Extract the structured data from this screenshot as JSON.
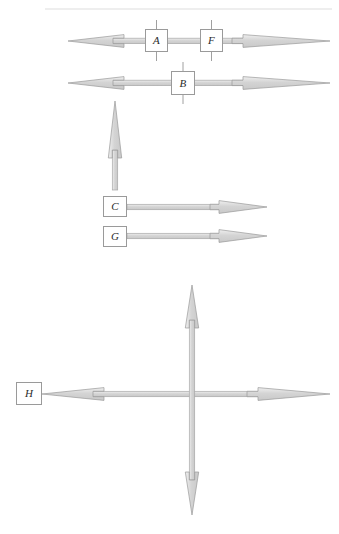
{
  "figure": {
    "background_color": "#ffffff",
    "width": 339,
    "height": 534,
    "top_rule": {
      "name": "header-rule",
      "color": "#e8e8e8",
      "x1": 45,
      "x2": 332,
      "y": 9
    },
    "palette": {
      "arrow_fill": "#d6d6d6",
      "arrow_fill_light": "#e4e4e4",
      "arrow_stroke": "#9a9a9a",
      "shaft_fill": "#dcdcdc",
      "shaft_stroke": "#a6a6a6",
      "box_stroke": "#9a9a9a",
      "box_fill": "#ffffff",
      "tick_color": "#a0a0a0",
      "text_color": "#2b2b2b"
    },
    "nodes": [
      {
        "id": "A",
        "label": "A",
        "x": 145,
        "y": 29,
        "size": "sz-a",
        "ticks": "vertical"
      },
      {
        "id": "F",
        "label": "F",
        "x": 200,
        "y": 29,
        "size": "sz-a",
        "ticks": "vertical"
      },
      {
        "id": "B",
        "label": "B",
        "x": 171,
        "y": 71,
        "size": "sz-b",
        "ticks": "vertical"
      },
      {
        "id": "C",
        "label": "C",
        "x": 103,
        "y": 196,
        "size": "sz-c",
        "ticks": "none"
      },
      {
        "id": "G",
        "label": "G",
        "x": 103,
        "y": 226,
        "size": "sz-c",
        "ticks": "none"
      },
      {
        "id": "H",
        "label": "H",
        "x": 16,
        "y": 382,
        "size": "sz-h",
        "ticks": "none"
      }
    ],
    "arrows": [
      {
        "name": "arrow-row-a-f",
        "orientation": "horizontal",
        "heads": "both",
        "y": 41,
        "x_start": 68,
        "x_end": 330,
        "description": "Double-headed horizontal arrow passing through boxes A and F"
      },
      {
        "name": "arrow-row-b",
        "orientation": "horizontal",
        "heads": "both",
        "y": 83,
        "x_start": 68,
        "x_end": 330,
        "description": "Double-headed horizontal arrow passing through box B"
      },
      {
        "name": "arrow-vertical-up",
        "orientation": "vertical",
        "heads": "up",
        "x": 115,
        "y_start": 190,
        "y_end": 101,
        "description": "Upward single-headed arrow rising from above box C"
      },
      {
        "name": "arrow-row-c",
        "orientation": "horizontal",
        "heads": "right",
        "y": 207,
        "x_start": 127,
        "x_end": 267,
        "description": "Rightward arrow from box C"
      },
      {
        "name": "arrow-row-g",
        "orientation": "horizontal",
        "heads": "right",
        "y": 236,
        "x_start": 127,
        "x_end": 267,
        "description": "Rightward arrow from box G"
      },
      {
        "name": "arrow-cross-horizontal",
        "orientation": "horizontal",
        "heads": "both",
        "y": 394,
        "x_start": 42,
        "x_end": 330,
        "description": "Double-headed horizontal arrow of the crossing pair, attached to box H"
      },
      {
        "name": "arrow-cross-vertical",
        "orientation": "vertical",
        "heads": "both",
        "x": 192,
        "y_start": 515,
        "y_end": 285,
        "description": "Double-headed vertical arrow of the crossing pair"
      }
    ]
  }
}
